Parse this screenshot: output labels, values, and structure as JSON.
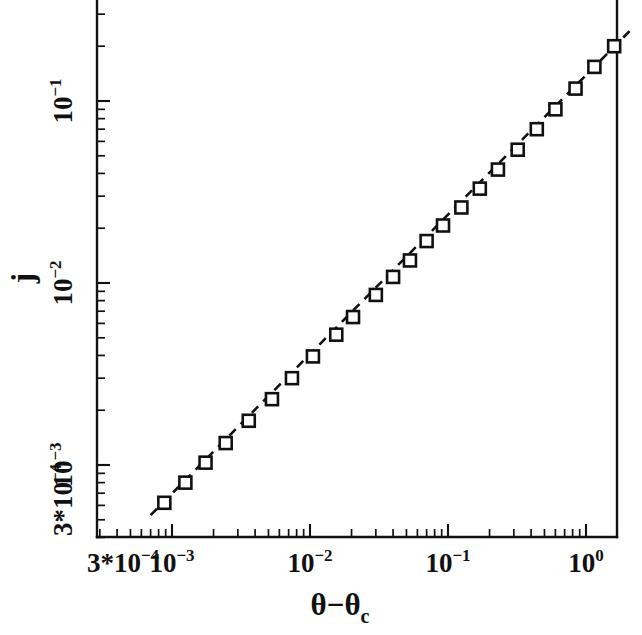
{
  "chart_data": {
    "type": "scatter",
    "title": "",
    "subtitle": "",
    "xlabel": "θ−θc",
    "ylabel": "j",
    "xscale": "log",
    "yscale": "log",
    "xlim": [
      0.0003,
      2.2
    ],
    "ylim": [
      0.0003,
      0.55
    ],
    "grid": false,
    "legend": null,
    "xticklabels": [
      {
        "value": 0.0003,
        "mantissa": "3*10",
        "exponent": "−4"
      },
      {
        "value": 0.001,
        "mantissa": "10",
        "exponent": "−3"
      },
      {
        "value": 0.01,
        "mantissa": "10",
        "exponent": "−2"
      },
      {
        "value": 0.1,
        "mantissa": "10",
        "exponent": "−1"
      },
      {
        "value": 1.0,
        "mantissa": "10",
        "exponent": "0"
      }
    ],
    "yticklabels": [
      {
        "value": 0.0003,
        "mantissa": "3*10",
        "exponent": "−4"
      },
      {
        "value": 0.001,
        "mantissa": "10",
        "exponent": "−3"
      },
      {
        "value": 0.01,
        "mantissa": "10",
        "exponent": "−2"
      },
      {
        "value": 0.1,
        "mantissa": "10",
        "exponent": "−1"
      }
    ],
    "series": [
      {
        "name": "data",
        "marker": "open-square",
        "x": [
          0.00088,
          0.00125,
          0.00175,
          0.00245,
          0.0036,
          0.0053,
          0.0074,
          0.0105,
          0.0155,
          0.0205,
          0.03,
          0.04,
          0.053,
          0.07,
          0.092,
          0.125,
          0.17,
          0.23,
          0.32,
          0.44,
          0.6,
          0.84,
          1.15,
          1.6
        ],
        "y": [
          0.00062,
          0.0008,
          0.00103,
          0.00132,
          0.00175,
          0.0023,
          0.003,
          0.00395,
          0.0052,
          0.0065,
          0.0086,
          0.0108,
          0.0133,
          0.017,
          0.0207,
          0.026,
          0.033,
          0.042,
          0.054,
          0.07,
          0.09,
          0.117,
          0.154,
          0.2
        ]
      },
      {
        "name": "power-law-fit",
        "style": "dashed",
        "x": [
          0.0007,
          2.1
        ],
        "y": [
          0.00053,
          0.245
        ],
        "slope_loglog": 0.762
      }
    ]
  },
  "figure": {
    "axis_color": "#111111",
    "marker_face_color": "#ffffff",
    "background": "#ffffff",
    "x_axis_title": "θ−θ",
    "x_axis_title_sub": "c",
    "y_axis_title": "j",
    "corner_label_mantissa": "3*10",
    "corner_label_exponent": "−4"
  }
}
